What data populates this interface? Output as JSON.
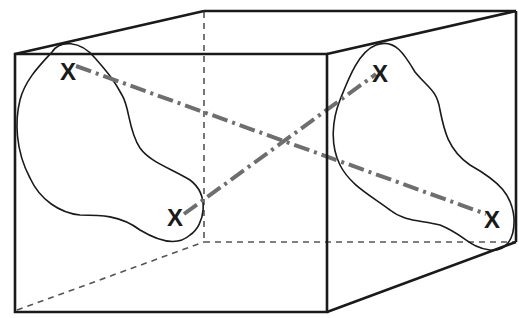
{
  "diagram": {
    "type": "cube-cross-section",
    "colors": {
      "edge": "#1a1a1a",
      "hidden_edge": "#555555",
      "connector": "#6e6e6e",
      "background": "#ffffff"
    },
    "markers": [
      {
        "label": "X",
        "x": 68,
        "y": 70
      },
      {
        "label": "X",
        "x": 176,
        "y": 216
      },
      {
        "label": "X",
        "x": 381,
        "y": 72
      },
      {
        "label": "X",
        "x": 493,
        "y": 218
      }
    ]
  }
}
